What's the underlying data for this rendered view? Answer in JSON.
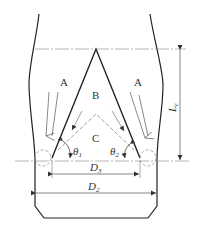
{
  "diagram": {
    "regions": {
      "A_left": "A",
      "A_right": "A",
      "B": "B",
      "C": "C"
    },
    "angles": {
      "theta1": "θ",
      "theta1_sub": "1",
      "theta2": "θ",
      "theta2_sub": "2"
    },
    "dimensions": {
      "D3": "D",
      "D3_sub": "3",
      "D2": "D",
      "D2_sub": "2",
      "Lc": "L",
      "Lc_sub": "c"
    },
    "colors": {
      "line": "#222222",
      "thin": "#555555",
      "dash": "#888888"
    }
  }
}
